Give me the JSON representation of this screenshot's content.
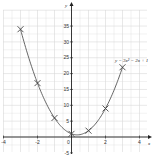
{
  "chart_data": {
    "type": "line",
    "title": "",
    "xlabel": "x",
    "ylabel": "y",
    "equation_label": "y = 3x² − 2x + 1",
    "xlim": [
      -4,
      4
    ],
    "ylim": [
      -5,
      40
    ],
    "x_ticks": [
      -4,
      -2,
      0,
      2,
      4
    ],
    "x_tick_labels": [
      "-4",
      "-2",
      "0",
      "2",
      "4"
    ],
    "y_ticks": [
      -5,
      5,
      10,
      15,
      20,
      25,
      30,
      35
    ],
    "y_tick_labels": [
      "-5",
      "5",
      "10",
      "15",
      "20",
      "25",
      "30",
      "35"
    ],
    "grid": true,
    "series": [
      {
        "name": "y = 3x² − 2x + 1",
        "marker": "x",
        "x": [
          -3,
          -2,
          -1,
          0,
          1,
          2,
          3
        ],
        "y": [
          34,
          17,
          6,
          1,
          2,
          9,
          22
        ]
      }
    ],
    "colors": {
      "grid": "#d9d9d9",
      "axis": "#222222",
      "curve": "#555555",
      "marker": "#444444"
    }
  }
}
